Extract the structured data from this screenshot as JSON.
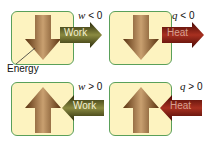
{
  "panels": [
    {
      "id": "work-out",
      "direction": "down",
      "arrow_label": "Work",
      "condition_var": "w",
      "condition_op": "< 0",
      "side": "out"
    },
    {
      "id": "heat-out",
      "direction": "down",
      "arrow_label": "Heat",
      "condition_var": "q",
      "condition_op": "< 0",
      "side": "out"
    },
    {
      "id": "work-in",
      "direction": "up",
      "arrow_label": "Work",
      "condition_var": "w",
      "condition_op": "> 0",
      "side": "in"
    },
    {
      "id": "heat-in",
      "direction": "up",
      "arrow_label": "Heat",
      "condition_var": "q",
      "condition_op": "> 0",
      "side": "in"
    }
  ],
  "energy_label": "Energy",
  "colors": {
    "box_fill": "#fdf3c0",
    "box_border": "#5aa05a",
    "energy_arrow": "#8a5a2b",
    "work_arrow": "#4a4a1a",
    "heat_arrow": "#7a1a12"
  }
}
